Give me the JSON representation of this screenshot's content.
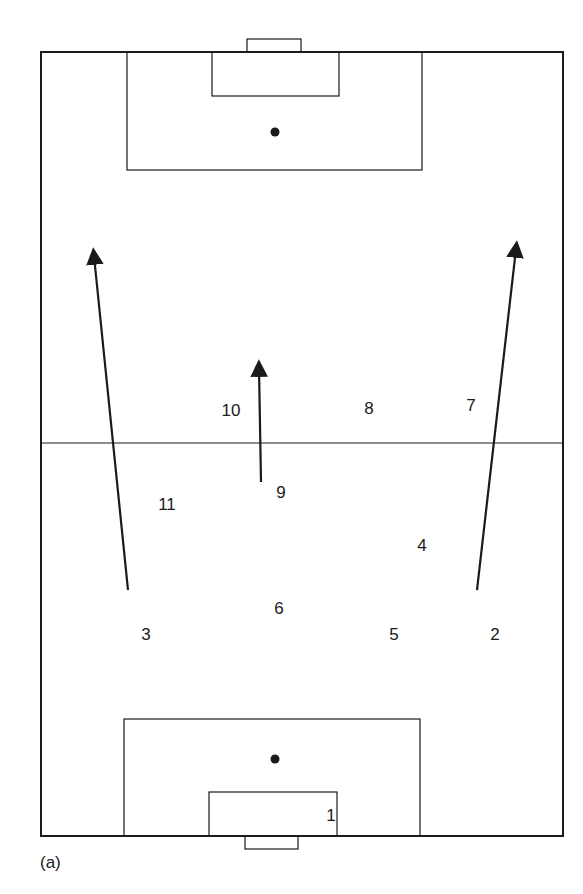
{
  "diagram": {
    "type": "soccer-pitch-formation",
    "caption": "(a)",
    "colors": {
      "line": "#1a1a1a",
      "background": "#ffffff"
    },
    "pitch": {
      "outer": {
        "x1": 41,
        "y1": 52,
        "x2": 563,
        "y2": 836
      },
      "halfway_line_y": 443,
      "top_goal": {
        "x1": 247,
        "y1": 39,
        "x2": 301,
        "y2": 52
      },
      "top_penalty_area": {
        "x1": 127,
        "y1": 52,
        "x2": 422,
        "y2": 170
      },
      "top_goal_area": {
        "x1": 212,
        "y1": 52,
        "x2": 339,
        "y2": 96
      },
      "top_penalty_spot": {
        "x": 275,
        "y": 132
      },
      "bottom_penalty_area": {
        "x1": 124,
        "y1": 719,
        "x2": 420,
        "y2": 836
      },
      "bottom_goal_area": {
        "x1": 209,
        "y1": 792,
        "x2": 337,
        "y2": 836
      },
      "bottom_penalty_spot": {
        "x": 275,
        "y": 759
      },
      "bottom_goal": {
        "x1": 245,
        "y1": 836,
        "x2": 298,
        "y2": 849
      }
    },
    "players": [
      {
        "number": "1",
        "x": 331,
        "y": 815
      },
      {
        "number": "2",
        "x": 495,
        "y": 634
      },
      {
        "number": "3",
        "x": 146,
        "y": 634
      },
      {
        "number": "4",
        "x": 422,
        "y": 545
      },
      {
        "number": "5",
        "x": 394,
        "y": 634
      },
      {
        "number": "6",
        "x": 279,
        "y": 608
      },
      {
        "number": "7",
        "x": 471,
        "y": 405
      },
      {
        "number": "8",
        "x": 369,
        "y": 408
      },
      {
        "number": "9",
        "x": 281,
        "y": 492
      },
      {
        "number": "10",
        "x": 231,
        "y": 410
      },
      {
        "number": "11",
        "x": 167,
        "y": 504
      }
    ],
    "arrows": [
      {
        "from_player": "3",
        "x1": 128,
        "y1": 590,
        "x2": 94,
        "y2": 256
      },
      {
        "from_player": "9",
        "x1": 261,
        "y1": 482,
        "x2": 259,
        "y2": 368
      },
      {
        "from_player": "2",
        "x1": 477,
        "y1": 590,
        "x2": 516,
        "y2": 249
      }
    ]
  }
}
